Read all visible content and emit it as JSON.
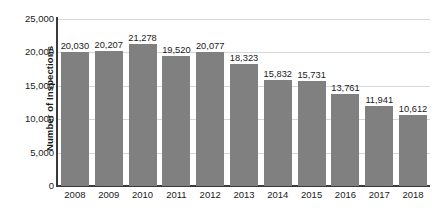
{
  "chart_data": {
    "type": "bar",
    "title": "",
    "xlabel": "",
    "ylabel": "Number of Inspections",
    "categories": [
      "2008",
      "2009",
      "2010",
      "2011",
      "2012",
      "2013",
      "2014",
      "2015",
      "2016",
      "2017",
      "2018"
    ],
    "values": [
      20030,
      20207,
      21278,
      19520,
      20077,
      18323,
      15832,
      15731,
      13761,
      11941,
      10612
    ],
    "value_labels": [
      "20,030",
      "20,207",
      "21,278",
      "19,520",
      "20,077",
      "18,323",
      "15,832",
      "15,731",
      "13,761",
      "11,941",
      "10,612"
    ],
    "ylim": [
      0,
      25000
    ],
    "y_ticks": [
      0,
      5000,
      10000,
      15000,
      20000,
      25000
    ],
    "y_tick_labels": [
      "0",
      "5,000",
      "10,000",
      "15,000",
      "20,000",
      "25,000"
    ],
    "grid": true,
    "legend": "none",
    "bar_color": "#808080",
    "gridline_color": "#d6d6d6",
    "axis_color": "#3a3a3a",
    "text_color": "#1a1a1a",
    "background_color": "#ffffff"
  }
}
